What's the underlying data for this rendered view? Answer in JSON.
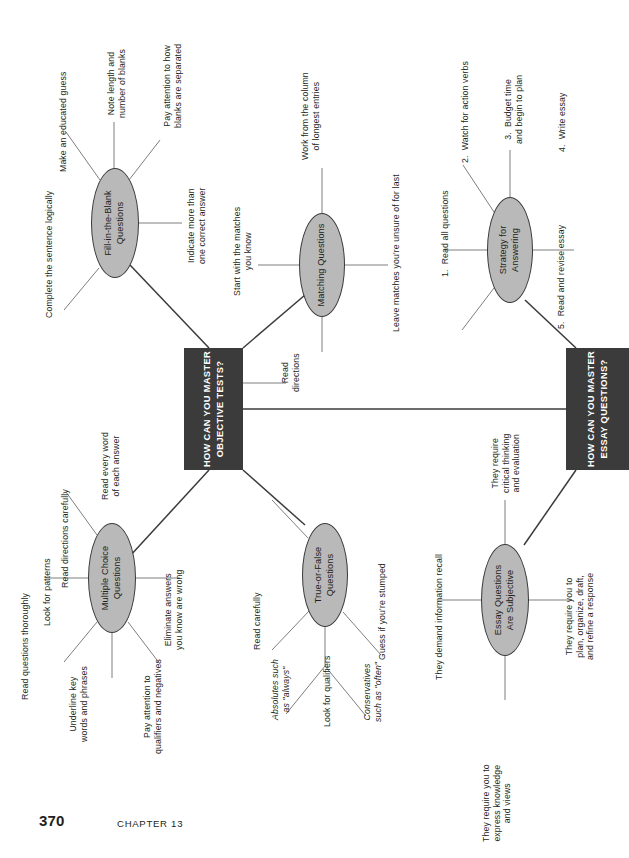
{
  "page": {
    "folio": "370",
    "chapter_label": "CHAPTER 13",
    "orientation": "rotated-90-ccw",
    "colors": {
      "node_fill": "#b9b9b9",
      "node_stroke": "#3a3a3a",
      "hub_fill": "#3b3b3b",
      "hub_text": "#ffffff",
      "line": "#6f6f6f",
      "text": "#231f20",
      "background": "#ffffff"
    }
  },
  "hubs": [
    {
      "id": "objective",
      "text": "HOW CAN YOU MASTER\nOBJECTIVE TESTS?"
    },
    {
      "id": "essay",
      "text": "HOW CAN YOU MASTER\nESSAY QUESTIONS?"
    }
  ],
  "nodes": [
    {
      "id": "fill-in-the-blank",
      "text": "Fill-in-the-Blank\nQuestions"
    },
    {
      "id": "matching",
      "text": "Matching Questions"
    },
    {
      "id": "strategy",
      "text": "Strategy for\nAnswering"
    },
    {
      "id": "multiple-choice",
      "text": "Multiple Choice\nQuestions"
    },
    {
      "id": "true-or-false",
      "text": "True-or-False\nQuestions"
    },
    {
      "id": "essay-subjective",
      "text": "Essay Questions\nAre Subjective"
    }
  ],
  "branches": {
    "fill_in_the_blank": [
      "Complete the sentence logically",
      "Make an educated guess",
      "Note length and\nnumber of blanks",
      "Pay attention to how\nblanks are separated",
      "Indicate more than\none correct answer"
    ],
    "matching": [
      "Start with the matches\nyou know",
      "Work from the column\nof longest entries",
      "Leave matches you're unsure of for last",
      "Read\ndirections"
    ],
    "strategy": [
      "1.  Read all questions",
      "2.  Watch for action verbs",
      "3.  Budget time\nand begin to plan",
      "4.  Write essay",
      "5.  Read and revise essay"
    ],
    "multiple_choice": [
      "Read directions carefully",
      "Read every word\nof each answer",
      "Look for patterns",
      "Eliminate answers\nyou know are wrong",
      "Read questions thoroughly",
      "Underline key\nwords and phrases",
      "Pay attention to\nqualifiers and negatives"
    ],
    "true_or_false": [
      "Read carefully",
      "Guess if you're stumped",
      "Look for qualifiers",
      "Absolutes such\nas \"always\"",
      "Conservatives\nsuch as \"often\""
    ],
    "essay_subjective": [
      "They demand information recall",
      "They require\ncritical thinking\nand evaluation",
      "They require you to\nplan, organize, draft,\nand refine a response",
      "They require you to\nexpress knowledge\nand views"
    ]
  }
}
